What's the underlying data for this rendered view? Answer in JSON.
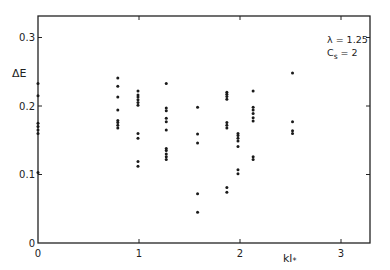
{
  "chart_data": {
    "type": "scatter",
    "title": "",
    "xlabel": "kl*",
    "ylabel": "ΔE",
    "xlim": [
      0,
      3.3
    ],
    "ylim": [
      0,
      0.33
    ],
    "xticks": [
      0,
      1,
      2,
      3
    ],
    "yticks": [
      0,
      0.1,
      0.2,
      0.3
    ],
    "xtick_labels": [
      "0",
      "1",
      "2",
      "3"
    ],
    "ytick_labels": [
      "0",
      "0.1",
      "0.2",
      "0.3"
    ],
    "grid": false,
    "annotation": {
      "line1": "λ = 1.25",
      "line2_main": "C",
      "line2_sub": "s",
      "line2_rest": " = 2"
    },
    "series": [
      {
        "name": "ΔE",
        "points": [
          [
            0,
            0.233
          ],
          [
            0,
            0.215
          ],
          [
            0,
            0.175
          ],
          [
            0,
            0.17
          ],
          [
            0,
            0.165
          ],
          [
            0,
            0.16
          ],
          [
            0,
            0.103
          ],
          [
            0.79,
            0.241
          ],
          [
            0.79,
            0.229
          ],
          [
            0.79,
            0.213
          ],
          [
            0.79,
            0.194
          ],
          [
            0.79,
            0.179
          ],
          [
            0.79,
            0.176
          ],
          [
            0.79,
            0.172
          ],
          [
            0.79,
            0.168
          ],
          [
            0.99,
            0.222
          ],
          [
            0.99,
            0.216
          ],
          [
            0.99,
            0.213
          ],
          [
            0.99,
            0.209
          ],
          [
            0.99,
            0.205
          ],
          [
            0.99,
            0.201
          ],
          [
            0.99,
            0.16
          ],
          [
            0.99,
            0.153
          ],
          [
            0.99,
            0.119
          ],
          [
            0.99,
            0.112
          ],
          [
            1.27,
            0.233
          ],
          [
            1.27,
            0.197
          ],
          [
            1.27,
            0.193
          ],
          [
            1.27,
            0.182
          ],
          [
            1.27,
            0.177
          ],
          [
            1.27,
            0.165
          ],
          [
            1.27,
            0.138
          ],
          [
            1.27,
            0.135
          ],
          [
            1.27,
            0.13
          ],
          [
            1.27,
            0.126
          ],
          [
            1.27,
            0.122
          ],
          [
            1.58,
            0.198
          ],
          [
            1.58,
            0.159
          ],
          [
            1.58,
            0.146
          ],
          [
            1.58,
            0.072
          ],
          [
            1.58,
            0.045
          ],
          [
            1.87,
            0.22
          ],
          [
            1.87,
            0.217
          ],
          [
            1.87,
            0.214
          ],
          [
            1.87,
            0.21
          ],
          [
            1.87,
            0.176
          ],
          [
            1.87,
            0.172
          ],
          [
            1.87,
            0.168
          ],
          [
            1.87,
            0.081
          ],
          [
            1.87,
            0.074
          ],
          [
            1.98,
            0.16
          ],
          [
            1.98,
            0.157
          ],
          [
            1.98,
            0.153
          ],
          [
            1.98,
            0.149
          ],
          [
            1.98,
            0.141
          ],
          [
            1.98,
            0.107
          ],
          [
            1.98,
            0.101
          ],
          [
            2.13,
            0.222
          ],
          [
            2.13,
            0.198
          ],
          [
            2.13,
            0.194
          ],
          [
            2.13,
            0.189
          ],
          [
            2.13,
            0.183
          ],
          [
            2.13,
            0.178
          ],
          [
            2.13,
            0.126
          ],
          [
            2.13,
            0.122
          ],
          [
            2.52,
            0.248
          ],
          [
            2.52,
            0.177
          ],
          [
            2.52,
            0.164
          ],
          [
            2.52,
            0.16
          ]
        ]
      }
    ]
  }
}
